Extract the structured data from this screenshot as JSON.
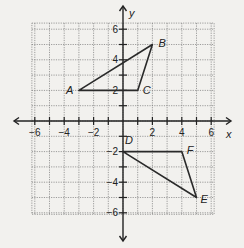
{
  "diagram": {
    "type": "coordinate-plane",
    "axes": {
      "x_label": "x",
      "y_label": "y",
      "range": [
        -6,
        6
      ]
    },
    "x_tick_labels": [
      "-6",
      "-4",
      "-2",
      "2",
      "4",
      "6"
    ],
    "y_tick_labels": [
      "6",
      "4",
      "2",
      "-2",
      "-4",
      "-6"
    ],
    "triangles": [
      {
        "name": "ABC",
        "vertices": [
          {
            "label": "A",
            "x": -3,
            "y": 2
          },
          {
            "label": "B",
            "x": 2,
            "y": 5
          },
          {
            "label": "C",
            "x": 1,
            "y": 2
          }
        ]
      },
      {
        "name": "DEF",
        "vertices": [
          {
            "label": "D",
            "x": 0,
            "y": -2
          },
          {
            "label": "E",
            "x": 5,
            "y": -5
          },
          {
            "label": "F",
            "x": 4,
            "y": -2
          }
        ]
      }
    ],
    "colors": {
      "background": "#f2f1ee",
      "grid": "#777777",
      "axes": "#222222",
      "shapes": "#2a2a2a"
    }
  }
}
